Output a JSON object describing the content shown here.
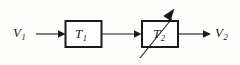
{
  "diagram": {
    "type": "block-diagram",
    "background_color": "#fdfdfc",
    "stroke_color": "#1a1a1a",
    "box_fill_color": "#ffffff",
    "signals": {
      "input": {
        "symbol": "V",
        "subscript": "1"
      },
      "output": {
        "symbol": "V",
        "subscript": "2"
      }
    },
    "blocks": [
      {
        "symbol": "T",
        "subscript": "1",
        "variable": false
      },
      {
        "symbol": "T",
        "subscript": "2",
        "variable": true
      }
    ],
    "connections": [
      {
        "from": "input",
        "to": "block-1",
        "arrow": true
      },
      {
        "from": "block-1",
        "to": "block-2",
        "arrow": true
      },
      {
        "from": "block-2",
        "to": "output",
        "arrow": true
      }
    ],
    "annotations": [
      {
        "name": "variable-arrow",
        "on": "block-2",
        "direction": "up-right",
        "meaning": "adjustable / variable element"
      }
    ]
  }
}
